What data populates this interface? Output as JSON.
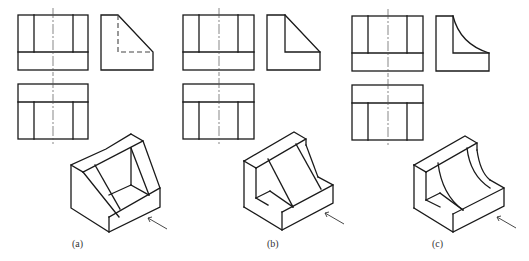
{
  "figure": {
    "panels": [
      {
        "id": "a",
        "label": "(a)",
        "side_view_feature": "hidden-line chamfer (inclined plane, through-slot)",
        "iso_feature": "inclined face with rectangular window"
      },
      {
        "id": "b",
        "label": "(b)",
        "side_view_feature": "L-shape with inclined rib",
        "iso_feature": "inclined triangular rib between walls"
      },
      {
        "id": "c",
        "label": "(c)",
        "side_view_feature": "L-shape with concave curve",
        "iso_feature": "curved concave rib between walls"
      }
    ],
    "colors": {
      "line": "#1a1a1a",
      "background": "#ffffff"
    }
  }
}
